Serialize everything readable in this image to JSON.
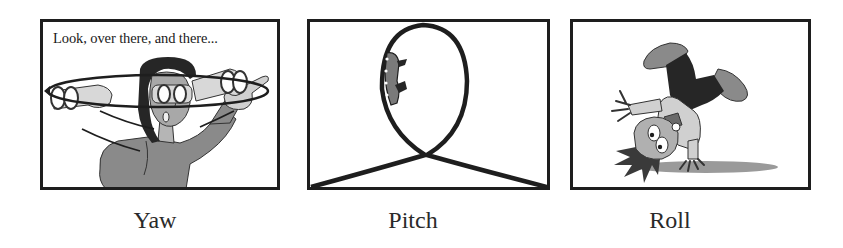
{
  "figure": {
    "panels": [
      {
        "id": "yaw",
        "caption": "Yaw",
        "speech_text": "Look, over there, and there...",
        "illustration": "person-with-binoculars-turning-head-horizontally"
      },
      {
        "id": "pitch",
        "caption": "Pitch",
        "illustration": "roller-coaster-vertical-loop"
      },
      {
        "id": "roll",
        "caption": "Roll",
        "illustration": "child-doing-cartwheel"
      }
    ],
    "colors": {
      "outline": "#1e1e1e",
      "dark_fill": "#262626",
      "mid_gray": "#8a8a8a",
      "light_gray": "#c8c8c8",
      "background": "#ffffff"
    }
  }
}
